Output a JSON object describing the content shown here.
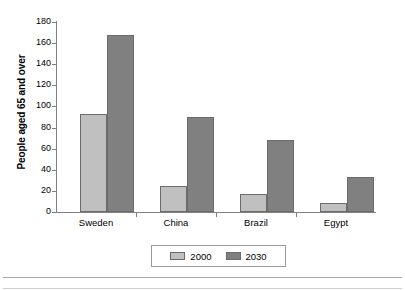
{
  "chart_data": {
    "type": "bar",
    "title": "",
    "xlabel": "",
    "ylabel": "People aged 65 and over",
    "categories": [
      "Sweden",
      "China",
      "Brazil",
      "Egypt"
    ],
    "series": [
      {
        "name": "2000",
        "color": "#c0c0c0",
        "values": [
          93,
          25,
          17,
          9
        ]
      },
      {
        "name": "2030",
        "color": "#808080",
        "values": [
          168,
          90,
          68,
          33
        ]
      }
    ],
    "ylim": [
      0,
      180
    ],
    "ytick_step": 20,
    "yticks": [
      180,
      160,
      140,
      120,
      100,
      80,
      60,
      40,
      20,
      0
    ],
    "ytick_labels": [
      "180",
      "160",
      "140",
      "120",
      "100",
      "80",
      "60",
      "40",
      "20",
      "0"
    ],
    "grid": false,
    "legend_position": "bottom"
  },
  "legend": {
    "entries": [
      {
        "label": "2000"
      },
      {
        "label": "2030"
      }
    ]
  },
  "colors": {
    "series_2000": "#c0c0c0",
    "series_2030": "#808080",
    "axis": "#808080",
    "bar_outline": "#6b6b6b",
    "rule": "#a8a8a8"
  }
}
